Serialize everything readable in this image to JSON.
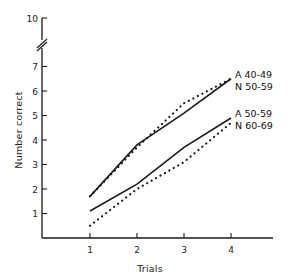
{
  "chart_data": {
    "type": "line",
    "title": "",
    "xlabel": "Trials",
    "ylabel": "Number correct",
    "x": [
      1,
      2,
      3,
      4
    ],
    "x_tick_labels": [
      "1",
      "2",
      "3",
      "4"
    ],
    "y_ticks": [
      1,
      2,
      3,
      4,
      5,
      6,
      7,
      10
    ],
    "y_tick_labels": [
      "1",
      "2",
      "3",
      "4",
      "5",
      "6",
      "7",
      "10"
    ],
    "ylim": [
      0,
      10
    ],
    "axis_break": {
      "between": [
        7,
        10
      ],
      "symbol": "//"
    },
    "grid": false,
    "legend_position": "inline-right",
    "series": [
      {
        "name": "A 40-49",
        "style": "solid",
        "values": [
          1.7,
          3.8,
          5.1,
          6.5
        ]
      },
      {
        "name": "N 50-59",
        "style": "dotted",
        "values": [
          1.7,
          3.7,
          5.5,
          6.5
        ]
      },
      {
        "name": "A 50-59",
        "style": "solid",
        "values": [
          1.1,
          2.2,
          3.7,
          4.9
        ]
      },
      {
        "name": "N 60-69",
        "style": "dotted",
        "values": [
          0.5,
          2.0,
          3.1,
          4.7
        ]
      }
    ],
    "group_labels": [
      {
        "lines": [
          "A 40-49",
          "N 50-59"
        ],
        "anchor_value": 6.5
      },
      {
        "lines": [
          "A 50-59",
          "N 60-69"
        ],
        "anchor_value": 4.9
      }
    ]
  },
  "colors": {
    "ink": "#1a1a1a",
    "background": "#ffffff"
  }
}
